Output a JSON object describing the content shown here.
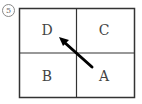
{
  "figure": {
    "number_label": "5",
    "cells": [
      {
        "id": "top-left",
        "label": "D"
      },
      {
        "id": "top-right",
        "label": "C"
      },
      {
        "id": "bottom-left",
        "label": "B"
      },
      {
        "id": "bottom-right",
        "label": "A"
      }
    ],
    "arrow": {
      "from": "A",
      "to": "D",
      "color": "#000000"
    },
    "line_color": "#333333"
  }
}
